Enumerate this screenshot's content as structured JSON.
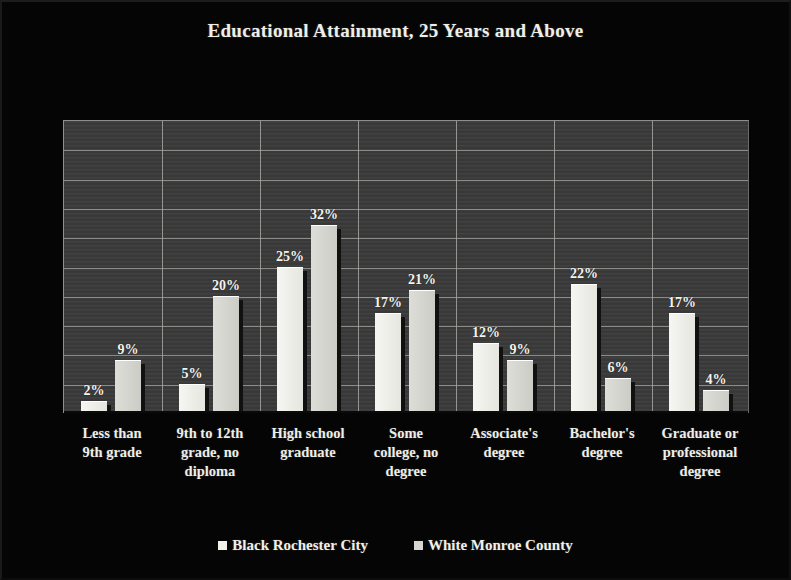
{
  "chart_data": {
    "type": "bar",
    "title": "Educational Attainment, 25 Years and Above",
    "xlabel": "",
    "ylabel": "",
    "ylim": [
      0,
      50
    ],
    "ytick_step": 5,
    "grid": "horizontal-and-vertical",
    "legend_position": "bottom-center",
    "value_labels": true,
    "value_label_suffix": "%",
    "categories": [
      "Less than 9th grade",
      "9th to 12th grade, no diploma",
      "High school graduate",
      "Some college, no degree",
      "Associate's degree",
      "Bachelor's degree",
      "Graduate or professional degree"
    ],
    "category_lines": [
      [
        "Less than",
        "9th grade"
      ],
      [
        "9th to 12th",
        "grade, no",
        "diploma"
      ],
      [
        "High school",
        "graduate"
      ],
      [
        "Some",
        "college, no",
        "degree"
      ],
      [
        "Associate's",
        "degree"
      ],
      [
        "Bachelor's",
        "degree"
      ],
      [
        "Graduate or",
        "professional",
        "degree"
      ]
    ],
    "series": [
      {
        "name": "Black Rochester City",
        "color": "#f2f2ec",
        "values": [
          2,
          5,
          25,
          17,
          12,
          22,
          17
        ],
        "labels": [
          "2%",
          "5%",
          "25%",
          "17%",
          "12%",
          "22%",
          "17%"
        ]
      },
      {
        "name": "White Monroe County",
        "color": "#d6d6d0",
        "values": [
          9,
          20,
          32,
          21,
          9,
          6,
          4
        ],
        "labels": [
          "9%",
          "20%",
          "32%",
          "21%",
          "9%",
          "6%",
          "4%"
        ]
      }
    ]
  },
  "colors": {
    "background": "#050505",
    "plot_background": "#3b3b3b",
    "gridline": "#9a9a96",
    "text": "#f0f0ea"
  }
}
